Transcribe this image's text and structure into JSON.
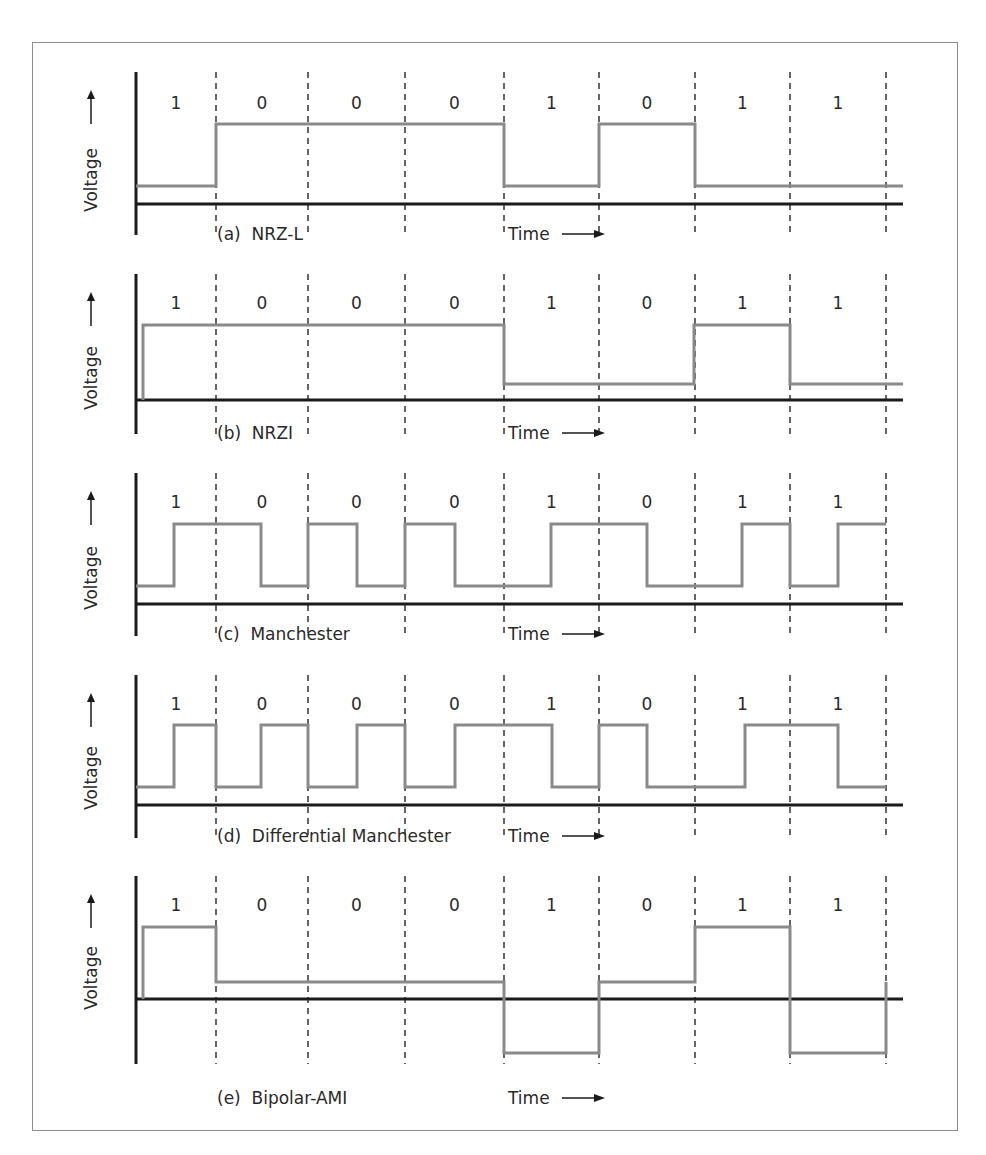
{
  "figure": {
    "title_fragment": "",
    "bits": [
      "1",
      "0",
      "0",
      "0",
      "1",
      "0",
      "1",
      "1"
    ],
    "y_axis_label": "Voltage",
    "x_axis_label": "Time",
    "boundaries_x": [
      136,
      216,
      308,
      405,
      504,
      599,
      695,
      790,
      886
    ],
    "colors": {
      "waveform": "#8a8a8a",
      "axis": "#1a1a1a",
      "frame": "#8c8c8c"
    },
    "panels": [
      {
        "id": "a",
        "label": "(a)  NRZ-L",
        "name": "NRZ-L",
        "axis_top": 72,
        "axis_bottom": 235,
        "baseline_y": 204,
        "bit_label_y": 103,
        "label_y": 234,
        "voltage_center_y": 160,
        "wave": [
          [
            136,
            186
          ],
          [
            216,
            186
          ],
          [
            216,
            124
          ],
          [
            504,
            124
          ],
          [
            504,
            186
          ],
          [
            599,
            186
          ],
          [
            599,
            124
          ],
          [
            695,
            124
          ],
          [
            695,
            186
          ],
          [
            903,
            186
          ]
        ]
      },
      {
        "id": "b",
        "label": "(b)  NRZI",
        "name": "NRZI",
        "axis_top": 274,
        "axis_bottom": 434,
        "baseline_y": 400,
        "bit_label_y": 303,
        "label_y": 433,
        "voltage_center_y": 358,
        "wave": [
          [
            143,
            400
          ],
          [
            143,
            325
          ],
          [
            504,
            325
          ],
          [
            504,
            384
          ],
          [
            694,
            384
          ],
          [
            694,
            325
          ],
          [
            790,
            325
          ],
          [
            790,
            384
          ],
          [
            903,
            384
          ]
        ]
      },
      {
        "id": "c",
        "label": "(c)  Manchester",
        "name": "Manchester",
        "axis_top": 473,
        "axis_bottom": 636,
        "baseline_y": 604,
        "bit_label_y": 502,
        "label_y": 634,
        "voltage_center_y": 558,
        "wave": [
          [
            136,
            586
          ],
          [
            174,
            586
          ],
          [
            174,
            524
          ],
          [
            261,
            524
          ],
          [
            261,
            586
          ],
          [
            308,
            586
          ],
          [
            308,
            524
          ],
          [
            357,
            524
          ],
          [
            357,
            586
          ],
          [
            405,
            586
          ],
          [
            405,
            524
          ],
          [
            455,
            524
          ],
          [
            455,
            586
          ],
          [
            551,
            586
          ],
          [
            551,
            524
          ],
          [
            647,
            524
          ],
          [
            647,
            586
          ],
          [
            742,
            586
          ],
          [
            742,
            524
          ],
          [
            790,
            524
          ],
          [
            790,
            586
          ],
          [
            838,
            586
          ],
          [
            838,
            524
          ],
          [
            886,
            524
          ]
        ]
      },
      {
        "id": "d",
        "label": "(d)  Differential Manchester",
        "name": "Differential Manchester",
        "axis_top": 675,
        "axis_bottom": 838,
        "baseline_y": 805,
        "bit_label_y": 704,
        "label_y": 836,
        "voltage_center_y": 758,
        "wave": [
          [
            136,
            787
          ],
          [
            174,
            787
          ],
          [
            174,
            725
          ],
          [
            216,
            725
          ],
          [
            216,
            787
          ],
          [
            261,
            787
          ],
          [
            261,
            725
          ],
          [
            308,
            725
          ],
          [
            308,
            787
          ],
          [
            357,
            787
          ],
          [
            357,
            725
          ],
          [
            405,
            725
          ],
          [
            405,
            787
          ],
          [
            455,
            787
          ],
          [
            455,
            725
          ],
          [
            552,
            725
          ],
          [
            552,
            787
          ],
          [
            599,
            787
          ],
          [
            599,
            725
          ],
          [
            647,
            725
          ],
          [
            647,
            787
          ],
          [
            745,
            787
          ],
          [
            745,
            725
          ],
          [
            838,
            725
          ],
          [
            838,
            787
          ],
          [
            886,
            787
          ]
        ]
      },
      {
        "id": "e",
        "label": "(e)  Bipolar-AMI",
        "name": "Bipolar-AMI",
        "axis_top": 876,
        "axis_bottom": 1064,
        "baseline_y": 999,
        "bit_label_y": 905,
        "label_y": 1098,
        "voltage_center_y": 958,
        "wave": [
          [
            143,
            999
          ],
          [
            143,
            927
          ],
          [
            216,
            927
          ],
          [
            216,
            982
          ],
          [
            504,
            982
          ],
          [
            504,
            1053
          ],
          [
            599,
            1053
          ],
          [
            599,
            982
          ],
          [
            695,
            982
          ],
          [
            695,
            927
          ],
          [
            790,
            927
          ],
          [
            790,
            1053
          ],
          [
            886,
            1053
          ],
          [
            886,
            982
          ]
        ]
      }
    ]
  }
}
